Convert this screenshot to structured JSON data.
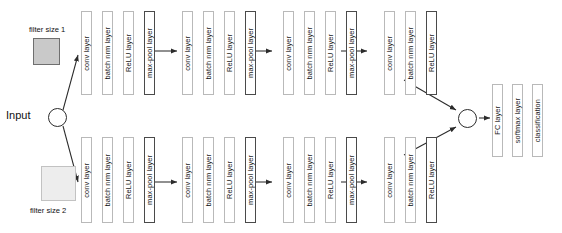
{
  "diagram": {
    "input": {
      "label": "Input",
      "node": "input-node"
    },
    "merge": {
      "node": "merge-node"
    },
    "filters": [
      {
        "id": "filter-1",
        "label": "filter size 1",
        "label_position": "above",
        "fill": "#c9c9c9",
        "stroke": "#6f6f6f",
        "size": 27
      },
      {
        "id": "filter-2",
        "label": "filter size 2",
        "label_position": "below",
        "fill": "#ededed",
        "stroke": "#c2c2c2",
        "size": 35
      }
    ],
    "branches": [
      {
        "id": "branch-top",
        "source_filter": "filter size 1",
        "layers": [
          {
            "label": "conv layer",
            "emphasis": "normal"
          },
          {
            "label": "batch nrm layer",
            "emphasis": "normal"
          },
          {
            "label": "ReLU layer",
            "emphasis": "normal"
          },
          {
            "label": "max-pool layer",
            "emphasis": "strong"
          },
          {
            "label": "conv layer",
            "emphasis": "normal"
          },
          {
            "label": "batch nrm layer",
            "emphasis": "normal"
          },
          {
            "label": "ReLU layer",
            "emphasis": "normal"
          },
          {
            "label": "max-pool layer",
            "emphasis": "strong"
          },
          {
            "label": "conv layer",
            "emphasis": "normal"
          },
          {
            "label": "batch nrm layer",
            "emphasis": "normal"
          },
          {
            "label": "ReLU layer",
            "emphasis": "normal"
          },
          {
            "label": "max-pool layer",
            "emphasis": "strong"
          },
          {
            "label": "conv layer",
            "emphasis": "normal"
          },
          {
            "label": "batch nrm layer",
            "emphasis": "normal"
          },
          {
            "label": "ReLU layer",
            "emphasis": "strong"
          }
        ]
      },
      {
        "id": "branch-bottom",
        "source_filter": "filter size 2",
        "layers": [
          {
            "label": "conv layer",
            "emphasis": "normal"
          },
          {
            "label": "batch nrm layer",
            "emphasis": "normal"
          },
          {
            "label": "ReLU layer",
            "emphasis": "normal"
          },
          {
            "label": "max-pool layer",
            "emphasis": "strong"
          },
          {
            "label": "conv layer",
            "emphasis": "normal"
          },
          {
            "label": "batch nrm layer",
            "emphasis": "normal"
          },
          {
            "label": "ReLU layer",
            "emphasis": "normal"
          },
          {
            "label": "max-pool layer",
            "emphasis": "strong"
          },
          {
            "label": "conv layer",
            "emphasis": "normal"
          },
          {
            "label": "batch nrm layer",
            "emphasis": "normal"
          },
          {
            "label": "ReLU layer",
            "emphasis": "normal"
          },
          {
            "label": "max-pool layer",
            "emphasis": "strong"
          },
          {
            "label": "conv layer",
            "emphasis": "normal"
          },
          {
            "label": "batch nrm layer",
            "emphasis": "normal"
          },
          {
            "label": "ReLU layer",
            "emphasis": "strong"
          }
        ]
      }
    ],
    "head_layers": [
      {
        "label": "FC layer",
        "emphasis": "normal"
      },
      {
        "label": "softmax layer",
        "emphasis": "normal"
      },
      {
        "label": "classification",
        "emphasis": "normal"
      }
    ]
  },
  "layout": {
    "branch_top_y": 11,
    "branch_top_h": 84,
    "branch_bottom_y": 137,
    "branch_bottom_h": 86,
    "head_y": 84,
    "head_h": 73,
    "box_width": 11,
    "box_gap": 10,
    "group_gap": 17,
    "branch_start_x": 81,
    "head_x": [
      492,
      512,
      532
    ]
  },
  "colors": {
    "box_border": "#b9b9b9",
    "box_border_strong": "#4a4a4a",
    "node_stroke": "#2b2b2b",
    "edge": "#2b2b2b",
    "text": "#1a1a1a",
    "background": "#ffffff"
  }
}
